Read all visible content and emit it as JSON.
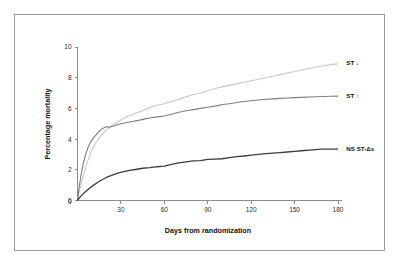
{
  "figure": {
    "background_color": "#ffffff",
    "frame_color": "#9a9a9a",
    "axis_color": "#8d8d8d"
  },
  "chart_data": {
    "type": "line",
    "title": "",
    "subtitle": "",
    "xlabel": "Days from randomization",
    "ylabel": "Percentage mortality",
    "xlim": [
      0,
      180
    ],
    "ylim": [
      0,
      10
    ],
    "xticks": [
      0,
      30,
      60,
      90,
      120,
      150,
      180
    ],
    "yticks": [
      0,
      2,
      4,
      6,
      8,
      10
    ],
    "xtick_labels": [
      "0",
      "30",
      "60",
      "90",
      "120",
      "150",
      "180"
    ],
    "ytick_labels": [
      "0",
      "2",
      "4",
      "6",
      "8",
      "10"
    ],
    "grid": false,
    "legend_position": "right-inline-annotations",
    "series": [
      {
        "name": "ST ↓",
        "label": "ST ↓",
        "color": "#c9c9c9",
        "stroke_width": 1.1,
        "label_x": 183,
        "label_y": 8.95,
        "x": [
          0,
          1,
          2,
          3,
          4,
          5,
          6,
          7,
          8,
          9,
          10,
          12,
          14,
          16,
          18,
          20,
          22,
          25,
          28,
          30,
          34,
          38,
          42,
          46,
          50,
          55,
          60,
          65,
          70,
          75,
          80,
          85,
          90,
          95,
          100,
          105,
          110,
          115,
          120,
          125,
          130,
          135,
          140,
          145,
          150,
          155,
          160,
          165,
          170,
          175,
          180
        ],
        "y": [
          0.0,
          0.45,
          0.85,
          1.25,
          1.6,
          1.95,
          2.25,
          2.55,
          2.8,
          3.05,
          3.3,
          3.65,
          3.95,
          4.2,
          4.4,
          4.6,
          4.75,
          4.95,
          5.15,
          5.25,
          5.45,
          5.6,
          5.75,
          5.9,
          6.05,
          6.2,
          6.3,
          6.45,
          6.6,
          6.75,
          6.9,
          7.0,
          7.15,
          7.3,
          7.4,
          7.5,
          7.6,
          7.7,
          7.8,
          7.9,
          8.0,
          8.1,
          8.2,
          8.3,
          8.4,
          8.5,
          8.6,
          8.7,
          8.78,
          8.85,
          8.9
        ]
      },
      {
        "name": "ST ↑",
        "label": "ST ↑",
        "color": "#7d7d7d",
        "stroke_width": 1.1,
        "label_x": 183,
        "label_y": 6.8,
        "x": [
          0,
          1,
          2,
          3,
          4,
          5,
          6,
          7,
          8,
          9,
          10,
          12,
          14,
          16,
          18,
          20,
          22,
          25,
          28,
          30,
          34,
          38,
          42,
          46,
          50,
          55,
          60,
          65,
          70,
          75,
          80,
          85,
          90,
          95,
          100,
          105,
          110,
          115,
          120,
          125,
          130,
          135,
          140,
          145,
          150,
          155,
          160,
          165,
          170,
          175,
          180
        ],
        "y": [
          0.0,
          0.75,
          1.4,
          1.95,
          2.4,
          2.8,
          3.1,
          3.4,
          3.6,
          3.8,
          3.95,
          4.2,
          4.4,
          4.6,
          4.72,
          4.8,
          4.78,
          4.85,
          4.95,
          5.0,
          5.08,
          5.15,
          5.22,
          5.3,
          5.38,
          5.45,
          5.5,
          5.62,
          5.75,
          5.85,
          5.92,
          6.0,
          6.08,
          6.15,
          6.25,
          6.3,
          6.38,
          6.45,
          6.5,
          6.55,
          6.6,
          6.62,
          6.65,
          6.68,
          6.7,
          6.72,
          6.74,
          6.76,
          6.78,
          6.79,
          6.8
        ]
      },
      {
        "name": "NS ST-Δs",
        "label": "NS ST-Δs",
        "color": "#3d3d3d",
        "stroke_width": 1.3,
        "label_x": 183,
        "label_y": 3.4,
        "x": [
          0,
          2,
          4,
          6,
          8,
          10,
          13,
          16,
          20,
          24,
          28,
          32,
          36,
          40,
          45,
          50,
          55,
          60,
          65,
          70,
          75,
          80,
          85,
          90,
          95,
          100,
          105,
          110,
          115,
          120,
          125,
          130,
          135,
          140,
          145,
          150,
          155,
          160,
          165,
          168,
          172,
          180
        ],
        "y": [
          0.0,
          0.25,
          0.45,
          0.6,
          0.78,
          0.92,
          1.12,
          1.3,
          1.5,
          1.65,
          1.78,
          1.88,
          1.96,
          2.02,
          2.1,
          2.14,
          2.2,
          2.24,
          2.35,
          2.45,
          2.52,
          2.58,
          2.6,
          2.68,
          2.7,
          2.72,
          2.8,
          2.86,
          2.9,
          2.96,
          3.0,
          3.05,
          3.08,
          3.12,
          3.16,
          3.2,
          3.24,
          3.28,
          3.32,
          3.35,
          3.35,
          3.35
        ]
      }
    ]
  }
}
